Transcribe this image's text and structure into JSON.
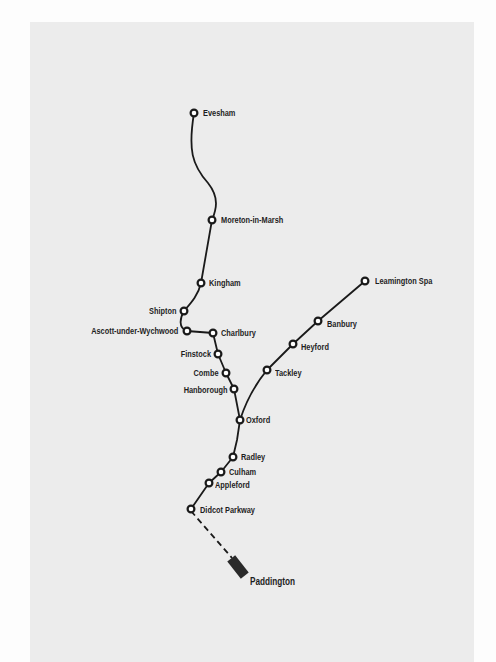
{
  "map": {
    "background_color": "#ececec",
    "line_color": "#1a1a1a",
    "stations": [
      {
        "name": "Evesham",
        "x": 194,
        "y": 113,
        "label_side": "right"
      },
      {
        "name": "Moreton-in-Marsh",
        "x": 212,
        "y": 220,
        "label_side": "right"
      },
      {
        "name": "Kingham",
        "x": 201,
        "y": 283,
        "label_side": "right"
      },
      {
        "name": "Shipton",
        "x": 184,
        "y": 311,
        "label_side": "left"
      },
      {
        "name": "Ascott-under-Wychwood",
        "x": 187,
        "y": 331,
        "label_side": "left"
      },
      {
        "name": "Charlbury",
        "x": 213,
        "y": 333,
        "label_side": "right"
      },
      {
        "name": "Finstock",
        "x": 218,
        "y": 354,
        "label_side": "left"
      },
      {
        "name": "Combe",
        "x": 226,
        "y": 373,
        "label_side": "left"
      },
      {
        "name": "Hanborough",
        "x": 234,
        "y": 389,
        "label_side": "left"
      },
      {
        "name": "Oxford",
        "x": 240,
        "y": 420,
        "label_side": "right"
      },
      {
        "name": "Radley",
        "x": 233,
        "y": 457,
        "label_side": "right"
      },
      {
        "name": "Culham",
        "x": 221,
        "y": 472,
        "label_side": "right"
      },
      {
        "name": "Appleford",
        "x": 209,
        "y": 483,
        "label_side": "right"
      },
      {
        "name": "Didcot Parkway",
        "x": 191,
        "y": 509,
        "label_side": "right"
      },
      {
        "name": "Tackley",
        "x": 267,
        "y": 370,
        "label_side": "right"
      },
      {
        "name": "Heyford",
        "x": 293,
        "y": 344,
        "label_side": "right"
      },
      {
        "name": "Banbury",
        "x": 318,
        "y": 321,
        "label_side": "right"
      },
      {
        "name": "Leamington Spa",
        "x": 365,
        "y": 281,
        "label_side": "right"
      }
    ],
    "terminus": {
      "name": "Paddington",
      "x": 240,
      "y": 566
    }
  },
  "labels": {
    "evesham": "Evesham",
    "moreton": "Moreton-in-Marsh",
    "kingham": "Kingham",
    "shipton": "Shipton",
    "ascott": "Ascott-under-Wychwood",
    "charlbury": "Charlbury",
    "finstock": "Finstock",
    "combe": "Combe",
    "hanborough": "Hanborough",
    "oxford": "Oxford",
    "radley": "Radley",
    "culham": "Culham",
    "appleford": "Appleford",
    "didcot": "Didcot Parkway",
    "tackley": "Tackley",
    "heyford": "Heyford",
    "banbury": "Banbury",
    "leamington": "Leamington Spa",
    "paddington": "Paddington"
  }
}
